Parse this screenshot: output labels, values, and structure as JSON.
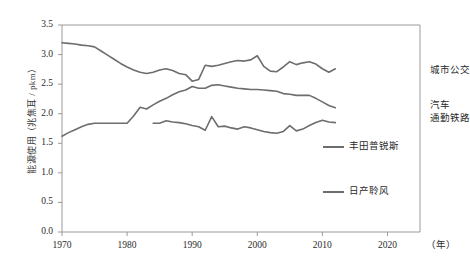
{
  "chart_data": {
    "type": "line",
    "title": "",
    "xlabel": "（年）",
    "ylabel": "能源使用（兆焦耳 / pkm）",
    "xlim": [
      1970,
      2025
    ],
    "ylim": [
      0.0,
      3.5
    ],
    "grid": false,
    "legend_position": "right",
    "xticks": [
      "1970",
      "1980",
      "1990",
      "2000",
      "2010",
      "2020"
    ],
    "xtick_values": [
      1970,
      1980,
      1990,
      2000,
      2010,
      2020
    ],
    "yticks": [
      "0.0",
      "0.5",
      "1.0",
      "1.5",
      "2.0",
      "2.5",
      "3.0",
      "3.5"
    ],
    "ytick_values": [
      0.0,
      0.5,
      1.0,
      1.5,
      2.0,
      2.5,
      3.0,
      3.5
    ],
    "series": [
      {
        "name": "城市公交",
        "color": "#6d6d6d",
        "annotation": "城市公交",
        "x": [
          1970,
          1971,
          1972,
          1973,
          1974,
          1975,
          1976,
          1977,
          1978,
          1979,
          1980,
          1981,
          1982,
          1983,
          1984,
          1985,
          1986,
          1987,
          1988,
          1989,
          1990,
          1991,
          1992,
          1993,
          1994,
          1995,
          1996,
          1997,
          1998,
          1999,
          2000,
          2001,
          2002,
          2003,
          2004,
          2005,
          2006,
          2007,
          2008,
          2009,
          2010,
          2011,
          2012
        ],
        "values": [
          3.2,
          3.19,
          3.18,
          3.16,
          3.15,
          3.13,
          3.06,
          2.99,
          2.92,
          2.85,
          2.79,
          2.74,
          2.7,
          2.68,
          2.7,
          2.74,
          2.76,
          2.73,
          2.68,
          2.66,
          2.55,
          2.58,
          2.82,
          2.8,
          2.82,
          2.85,
          2.88,
          2.9,
          2.89,
          2.91,
          2.98,
          2.8,
          2.72,
          2.71,
          2.79,
          2.88,
          2.83,
          2.86,
          2.88,
          2.84,
          2.76,
          2.7,
          2.76
        ]
      },
      {
        "name": "汽车",
        "color": "#6d6d6d",
        "annotation": "汽车",
        "x": [
          1970,
          1971,
          1972,
          1973,
          1974,
          1975,
          1976,
          1977,
          1978,
          1979,
          1980,
          1981,
          1982,
          1983,
          1984,
          1985,
          1986,
          1987,
          1988,
          1989,
          1990,
          1991,
          1992,
          1993,
          1994,
          1995,
          1996,
          1997,
          1998,
          1999,
          2000,
          2001,
          2002,
          2003,
          2004,
          2005,
          2006,
          2007,
          2008,
          2009,
          2010,
          2011,
          2012
        ],
        "values": [
          1.62,
          1.68,
          1.73,
          1.78,
          1.82,
          1.84,
          1.84,
          1.84,
          1.84,
          1.84,
          1.84,
          1.96,
          2.11,
          2.08,
          2.15,
          2.21,
          2.26,
          2.32,
          2.37,
          2.4,
          2.46,
          2.43,
          2.43,
          2.48,
          2.49,
          2.47,
          2.45,
          2.43,
          2.42,
          2.41,
          2.41,
          2.4,
          2.39,
          2.38,
          2.34,
          2.33,
          2.31,
          2.31,
          2.31,
          2.26,
          2.2,
          2.14,
          2.1
        ]
      },
      {
        "name": "通勤铁路",
        "color": "#6d6d6d",
        "annotation": "通勤铁路",
        "x": [
          1984,
          1985,
          1986,
          1987,
          1988,
          1989,
          1990,
          1991,
          1992,
          1993,
          1994,
          1995,
          1996,
          1997,
          1998,
          1999,
          2000,
          2001,
          2002,
          2003,
          2004,
          2005,
          2006,
          2007,
          2008,
          2009,
          2010,
          2011,
          2012
        ],
        "values": [
          1.84,
          1.84,
          1.88,
          1.86,
          1.85,
          1.83,
          1.8,
          1.78,
          1.72,
          1.95,
          1.78,
          1.79,
          1.76,
          1.74,
          1.78,
          1.76,
          1.73,
          1.7,
          1.68,
          1.67,
          1.7,
          1.8,
          1.71,
          1.74,
          1.8,
          1.85,
          1.89,
          1.86,
          1.85
        ]
      },
      {
        "name": "丰田普锐斯",
        "color": "#6d6d6d",
        "annotation": "丰田普锐斯",
        "x": [],
        "values": []
      },
      {
        "name": "日产聆风",
        "color": "#6d6d6d",
        "annotation": "日产聆风",
        "x": [],
        "values": []
      }
    ],
    "legend_entries": [
      {
        "label": "城市公交",
        "type": "annotation"
      },
      {
        "label": "汽车",
        "type": "annotation"
      },
      {
        "label": "通勤铁路",
        "type": "annotation"
      },
      {
        "label": "丰田普锐斯",
        "type": "swatch"
      },
      {
        "label": "日产聆风",
        "type": "swatch"
      }
    ],
    "colors": {
      "line": "#6d6d6d",
      "axis": "#9a9a9a",
      "text": "#2b2b2b"
    }
  }
}
